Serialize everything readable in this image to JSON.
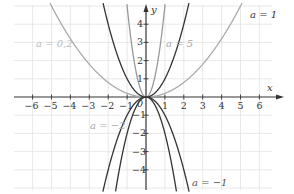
{
  "chart_data": {
    "type": "line",
    "title": "",
    "function": "y = a·x^2",
    "xlabel": "x",
    "ylabel": "y",
    "xlim": [
      -6.5,
      6.5
    ],
    "ylim": [
      -5,
      5
    ],
    "grid": true,
    "x_ticks": [
      -6,
      -5,
      -4,
      -3,
      -2,
      -1,
      0,
      1,
      2,
      3,
      4,
      5,
      6
    ],
    "y_ticks": [
      -4,
      -3,
      -2,
      -1,
      1,
      2,
      3,
      4
    ],
    "origin_label": "0",
    "series": [
      {
        "name": "a = 0,2",
        "a": 0.2,
        "color": "#aaaaaa"
      },
      {
        "name": "a = 1",
        "a": 1,
        "color": "#333333"
      },
      {
        "name": "a = 5",
        "a": 5,
        "color": "#999999"
      },
      {
        "name": "a = −1",
        "a": -1,
        "color": "#333333"
      },
      {
        "name": "a = −2",
        "a": -2,
        "color": "#333333"
      }
    ]
  },
  "labels": {
    "x_axis": "x",
    "y_axis": "y",
    "origin": "0",
    "a02": "a = 0,2",
    "a1": "a = 1",
    "a5": "a = 5",
    "am2": "a = −2",
    "am1": "a = −1"
  },
  "ticks": {
    "x": [
      "−6",
      "−5",
      "−4",
      "−3",
      "−2",
      "−1",
      "1",
      "2",
      "3",
      "4",
      "5",
      "6"
    ],
    "y": [
      "4",
      "3",
      "2",
      "1",
      "−1",
      "−2",
      "−3",
      "−4"
    ]
  }
}
